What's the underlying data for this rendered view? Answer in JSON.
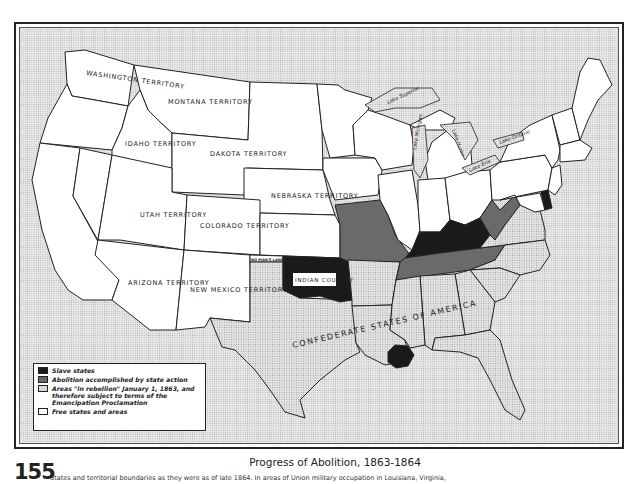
{
  "page": {
    "number": "155",
    "title": "Progress of Abolition, 1863-1864",
    "caption_partial": "States and territorial boundaries as they were as of late 1864. In areas of Union military occupation in Louisiana, Virginia,"
  },
  "map": {
    "labels": {
      "washington": "WASHINGTON TERRITORY",
      "montana": "MONTANA TERRITORY",
      "idaho": "IDAHO TERRITORY",
      "dakota": "DAKOTA TERRITORY",
      "nebraska": "NEBRASKA TERRITORY",
      "utah": "UTAH TERRITORY",
      "colorado": "COLORADO TERRITORY",
      "arizona": "ARIZONA TERRITORY",
      "new_mexico": "NEW MEXICO TERRITORY",
      "indian_country": "INDIAN COUNTRY",
      "no_mans_land": "NO MAN'S LAND",
      "confederacy": "CONFEDERATE STATES OF AMERICA"
    },
    "lakes": {
      "superior": "Lake Superior",
      "michigan": "Lake Michigan",
      "huron": "Lake Huron",
      "erie": "Lake Erie",
      "ontario": "Lake Ontario"
    },
    "colors": {
      "slave": "#1a1a1a",
      "abolition": "#6a6a6a",
      "rebellion": "#d6d6d6",
      "free": "#ffffff",
      "water": "#dcdcdc"
    }
  },
  "legend": {
    "items": [
      {
        "key": "slave",
        "label": "Slave states"
      },
      {
        "key": "abolition",
        "label": "Abolition accomplished by state action"
      },
      {
        "key": "rebellion",
        "label": "Areas \"in rebellion\" January 1, 1863, and therefore subject to terms of the Emancipation Proclamation"
      },
      {
        "key": "free",
        "label": "Free states and areas"
      }
    ]
  }
}
